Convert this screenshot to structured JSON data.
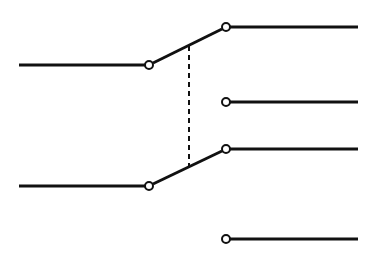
{
  "diagram": {
    "type": "DPDT switch schematic",
    "colors": {
      "line": "#111111",
      "background": "#ffffff",
      "terminal_fill": "#ffffff"
    },
    "poles": [
      {
        "name": "pole-1",
        "input_wire": {
          "x1": 19,
          "y1": 65,
          "x2": 145,
          "y2": 65
        },
        "pivot": {
          "cx": 149,
          "cy": 65
        },
        "arm": {
          "x1": 153,
          "y1": 63,
          "x2": 222,
          "y2": 29
        },
        "throws": [
          {
            "name": "throw-1a",
            "terminal": {
              "cx": 226,
              "cy": 27
            },
            "wire": {
              "x1": 230,
              "y1": 27,
              "x2": 358,
              "y2": 27
            },
            "connected": true
          },
          {
            "name": "throw-1b",
            "terminal": {
              "cx": 226,
              "cy": 102
            },
            "wire": {
              "x1": 230,
              "y1": 102,
              "x2": 358,
              "y2": 102
            },
            "connected": false
          }
        ]
      },
      {
        "name": "pole-2",
        "input_wire": {
          "x1": 19,
          "y1": 186,
          "x2": 145,
          "y2": 186
        },
        "pivot": {
          "cx": 149,
          "cy": 186
        },
        "arm": {
          "x1": 153,
          "y1": 184,
          "x2": 222,
          "y2": 151
        },
        "throws": [
          {
            "name": "throw-2a",
            "terminal": {
              "cx": 226,
              "cy": 149
            },
            "wire": {
              "x1": 230,
              "y1": 149,
              "x2": 358,
              "y2": 149
            },
            "connected": true
          },
          {
            "name": "throw-2b",
            "terminal": {
              "cx": 226,
              "cy": 239
            },
            "wire": {
              "x1": 230,
              "y1": 239,
              "x2": 358,
              "y2": 239
            },
            "connected": false
          }
        ]
      }
    ],
    "mechanical_link": {
      "x1": 189,
      "y1": 46,
      "x2": 189,
      "y2": 166,
      "style": "dashed"
    },
    "terminal_radius": 4
  }
}
